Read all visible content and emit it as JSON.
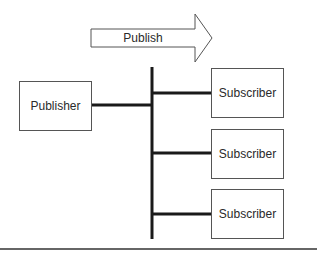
{
  "diagram": {
    "type": "publish-subscribe",
    "arrow": {
      "label": "Publish",
      "direction": "right"
    },
    "publisher": {
      "label": "Publisher"
    },
    "subscribers": [
      {
        "label": "Subscriber"
      },
      {
        "label": "Subscriber"
      },
      {
        "label": "Subscriber"
      }
    ],
    "colors": {
      "line": "#1a1a1a",
      "box_border": "#555555",
      "background": "#ffffff"
    }
  }
}
